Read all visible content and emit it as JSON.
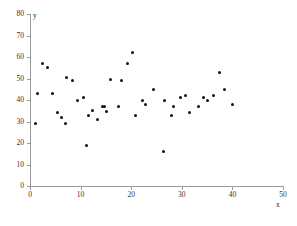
{
  "chart_data": {
    "type": "scatter",
    "title": "",
    "subtitle": "",
    "xlabel": "x",
    "ylabel": "y",
    "xlim": [
      0,
      50
    ],
    "ylim": [
      0,
      80
    ],
    "xticks": [
      0,
      10,
      20,
      30,
      40,
      50
    ],
    "yticks": [
      0,
      10,
      20,
      30,
      40,
      50,
      60,
      70,
      80
    ],
    "xtick_labels": [
      "0",
      "10",
      "20",
      "30",
      "40",
      "50"
    ],
    "ytick_labels": [
      "0",
      "10",
      "20",
      "30",
      "40",
      "50",
      "60",
      "70",
      "80"
    ],
    "grid": false,
    "legend": null,
    "legend_position": "none",
    "marker": "filled-circle",
    "marker_color": "#111111",
    "axis_color": "#9a9a9a",
    "background_color": "#ffffff",
    "annotations": [],
    "points": [
      {
        "x": 1.0,
        "y": 29
      },
      {
        "x": 1.5,
        "y": 43
      },
      {
        "x": 2.5,
        "y": 57
      },
      {
        "x": 3.5,
        "y": 55
      },
      {
        "x": 4.5,
        "y": 43
      },
      {
        "x": 5.5,
        "y": 34
      },
      {
        "x": 6.3,
        "y": 32
      },
      {
        "x": 7.0,
        "y": 29
      },
      {
        "x": 7.3,
        "y": 50.5
      },
      {
        "x": 8.4,
        "y": 49
      },
      {
        "x": 9.3,
        "y": 40
      },
      {
        "x": 10.5,
        "y": 41
      },
      {
        "x": 11.2,
        "y": 19
      },
      {
        "x": 11.6,
        "y": 33
      },
      {
        "x": 12.4,
        "y": 35
      },
      {
        "x": 13.3,
        "y": 31
      },
      {
        "x": 14.3,
        "y": 37
      },
      {
        "x": 14.8,
        "y": 37
      },
      {
        "x": 15.2,
        "y": 34.5
      },
      {
        "x": 16.0,
        "y": 49.5
      },
      {
        "x": 17.5,
        "y": 37
      },
      {
        "x": 18.0,
        "y": 49
      },
      {
        "x": 19.3,
        "y": 57
      },
      {
        "x": 20.2,
        "y": 62
      },
      {
        "x": 20.8,
        "y": 33
      },
      {
        "x": 22.2,
        "y": 40
      },
      {
        "x": 22.9,
        "y": 38
      },
      {
        "x": 24.4,
        "y": 45
      },
      {
        "x": 26.3,
        "y": 16
      },
      {
        "x": 26.6,
        "y": 40
      },
      {
        "x": 28.0,
        "y": 33
      },
      {
        "x": 28.4,
        "y": 37
      },
      {
        "x": 29.8,
        "y": 41
      },
      {
        "x": 30.8,
        "y": 42
      },
      {
        "x": 31.5,
        "y": 34
      },
      {
        "x": 33.3,
        "y": 37
      },
      {
        "x": 34.3,
        "y": 41
      },
      {
        "x": 35.0,
        "y": 40
      },
      {
        "x": 36.2,
        "y": 42
      },
      {
        "x": 37.5,
        "y": 53
      },
      {
        "x": 38.4,
        "y": 45
      },
      {
        "x": 40.0,
        "y": 38
      }
    ]
  }
}
